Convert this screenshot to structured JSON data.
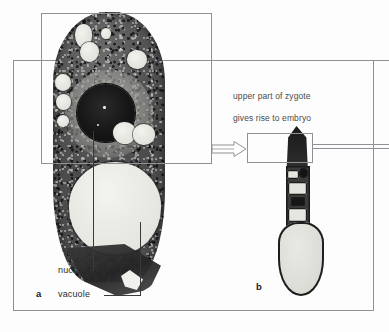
{
  "figure": {
    "type": "micrograph-diagram",
    "background_color": "#fdfdfd",
    "frame_color": "#8e9196",
    "panels": [
      {
        "letter": "a",
        "name": "zygote-section",
        "description": "electron micrograph of a zygote in longitudinal section",
        "labels": [
          {
            "text": "nucleus",
            "points_to": "dark spherical nucleus in upper cell region"
          },
          {
            "text": "vacuole",
            "points_to": "large pale vacuole in lower cell region"
          }
        ]
      },
      {
        "letter": "b",
        "name": "embryo-suspensor",
        "description": "elongated embryo with suspensor and large basal cell"
      }
    ],
    "callout_caption": "upper part of zygote\ngives rise to embryo",
    "arrow": {
      "name": "open-arrow",
      "direction": "right",
      "style": "hollow-outline",
      "from": "panel-a-callout-box",
      "to": "panel-b-callout-box"
    }
  },
  "labels": {
    "nucleus": "nucleus",
    "vacuole": "vacuole",
    "panel_a": "a",
    "panel_b": "b",
    "caption_line_1": "upper part of zygote",
    "caption_line_2": "gives rise to embryo"
  }
}
